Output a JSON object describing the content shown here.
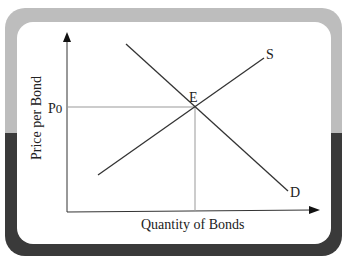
{
  "diagram": {
    "type": "supply-demand",
    "y_axis_label": "Price per Bond",
    "x_axis_label": "Quantity of Bonds",
    "price_label": "P",
    "price_subscript": "0",
    "equilibrium_label": "E",
    "supply_label": "S",
    "demand_label": "D"
  },
  "colors": {
    "frame_top": "#bdbdbd",
    "frame_bottom": "#3a3a3a",
    "card": "#ffffff",
    "line": "#333333",
    "guide": "#999999"
  }
}
